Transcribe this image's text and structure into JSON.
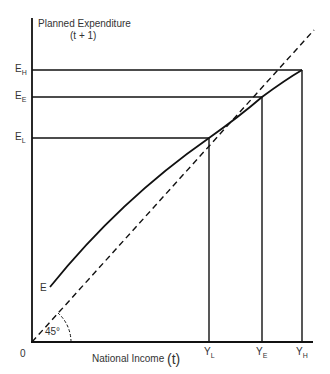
{
  "diagram": {
    "y_axis_title": "Planned Expenditure",
    "y_axis_subtitle": "(t + 1)",
    "x_axis_title": "National Income",
    "x_axis_paren": "(t)",
    "origin_label": "0",
    "curve_label": "E",
    "angle_label": "45°",
    "y_levels": [
      {
        "main": "E",
        "sub": "H"
      },
      {
        "main": "E",
        "sub": "E"
      },
      {
        "main": "E",
        "sub": "L"
      }
    ],
    "x_levels": [
      {
        "main": "Y",
        "sub": "L"
      },
      {
        "main": "Y",
        "sub": "E"
      },
      {
        "main": "Y",
        "sub": "H"
      }
    ]
  }
}
